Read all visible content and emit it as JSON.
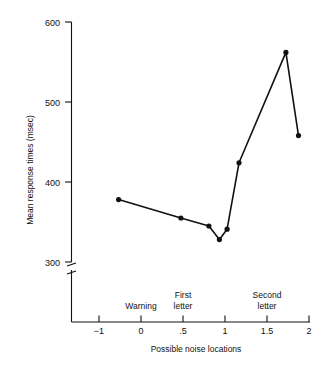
{
  "chart_data": {
    "type": "line",
    "title": "",
    "xlabel": "Possible noise locations",
    "ylabel": "Mean response times (msec)",
    "xlim": [
      -1.35,
      2.0
    ],
    "ylim": [
      300,
      600
    ],
    "grid": false,
    "legend": "none",
    "axis_break": true,
    "axis_break_note": "y-axis broken below 300",
    "yticks": [
      300,
      400,
      500,
      600
    ],
    "ytick_labels": [
      "300",
      "400",
      "500",
      "600"
    ],
    "xticks": [
      -1,
      0,
      0.5,
      1,
      1.5,
      2
    ],
    "xtick_labels": [
      "−1",
      "0",
      ".5",
      "1",
      "1.5",
      "2"
    ],
    "series": [
      {
        "name": "Mean response time",
        "marker": "filled-circle",
        "x": [
          -0.72,
          0.17,
          0.57,
          0.72,
          0.83,
          1.0,
          1.67,
          1.85
        ],
        "values": [
          378,
          355,
          345,
          328,
          341,
          424,
          562,
          458
        ]
      }
    ],
    "annotations": [
      {
        "text": "Warning",
        "lines": [
          "Warning"
        ],
        "x": 0.0,
        "y_px": 306
      },
      {
        "text": "First letter",
        "lines": [
          "First",
          "letter"
        ],
        "x": 0.5,
        "y_px": 295
      },
      {
        "text": "Second letter",
        "lines": [
          "Second",
          "letter"
        ],
        "x": 1.5,
        "y_px": 295
      }
    ]
  },
  "labels": {
    "y_axis_title": "Mean response times (msec)",
    "x_axis_title": "Possible noise locations",
    "y_tick_600": "600",
    "y_tick_500": "500",
    "y_tick_400": "400",
    "y_tick_300": "300",
    "x_tick_neg1": "−1",
    "x_tick_0": "0",
    "x_tick_half": ".5",
    "x_tick_1": "1",
    "x_tick_1half": "1.5",
    "x_tick_2": "2",
    "annot_warning": "Warning",
    "annot_first_1": "First",
    "annot_first_2": "letter",
    "annot_second_1": "Second",
    "annot_second_2": "letter"
  },
  "colors": {
    "ink": "#111111",
    "background": "#ffffff"
  }
}
